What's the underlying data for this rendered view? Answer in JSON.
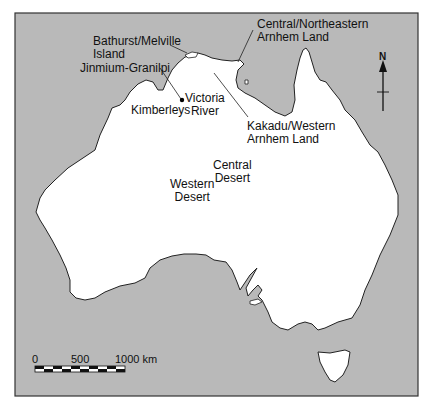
{
  "map": {
    "title": "Australia rock art regions",
    "colors": {
      "sea": "#b9b9b9",
      "land": "#ffffff",
      "frame": "#333333",
      "coast": "#222222"
    },
    "labels": [
      {
        "id": "bathurst",
        "lines": [
          "Bathurst/Melville",
          "Island"
        ]
      },
      {
        "id": "jinmium",
        "lines": [
          "Jinmium-Granilpi"
        ]
      },
      {
        "id": "kimberleys",
        "lines": [
          "Kimberleys"
        ]
      },
      {
        "id": "victoria",
        "lines": [
          "Victoria",
          "River"
        ]
      },
      {
        "id": "central_ne_arnhem",
        "lines": [
          "Central/Northeastern",
          "Arnhem Land"
        ]
      },
      {
        "id": "kakadu",
        "lines": [
          "Kakadu/Western",
          "Arnhem Land"
        ]
      },
      {
        "id": "central_desert",
        "lines": [
          "Central",
          "Desert"
        ]
      },
      {
        "id": "western_desert",
        "lines": [
          "Western",
          "Desert"
        ]
      }
    ],
    "north_arrow": {
      "label": "N"
    },
    "scale_bar": {
      "ticks": [
        "0",
        "500",
        "1000 km"
      ]
    }
  }
}
